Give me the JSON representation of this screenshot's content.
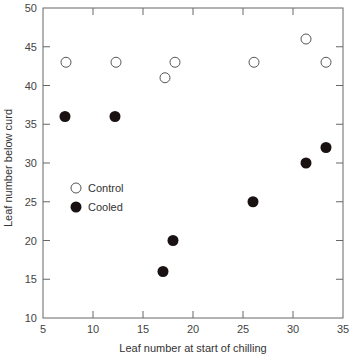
{
  "chart_data": {
    "type": "scatter",
    "title": "",
    "xlabel": "Leaf number at start of chilling",
    "ylabel": "Leaf number below curd",
    "xlim": [
      5,
      35
    ],
    "ylim": [
      10,
      50
    ],
    "xticks": [
      5,
      10,
      15,
      20,
      25,
      30,
      35
    ],
    "yticks": [
      10,
      15,
      20,
      25,
      30,
      35,
      40,
      45,
      50
    ],
    "grid": false,
    "legend_position": "inside-left-middle",
    "series": [
      {
        "name": "Control",
        "marker": "open-circle",
        "color": "#ffffff",
        "x": [
          7.3,
          12.3,
          17.2,
          18.2,
          26.1,
          31.3,
          33.3
        ],
        "y": [
          43,
          43,
          41,
          43,
          43,
          46,
          43
        ]
      },
      {
        "name": "Cooled",
        "marker": "filled-circle",
        "color": "#1a1212",
        "x": [
          7.2,
          12.2,
          17.0,
          18.0,
          26.0,
          31.3,
          33.3
        ],
        "y": [
          36,
          36,
          16,
          20,
          25,
          30,
          32
        ]
      }
    ]
  },
  "labels": {
    "xlabel": "Leaf number at start of chilling",
    "ylabel": "Leaf number below curd",
    "legend_control": "Control",
    "legend_cooled": "Cooled",
    "xticks": [
      "5",
      "10",
      "15",
      "20",
      "25",
      "30",
      "35"
    ],
    "yticks": [
      "10",
      "15",
      "20",
      "25",
      "30",
      "35",
      "40",
      "45",
      "50"
    ]
  }
}
